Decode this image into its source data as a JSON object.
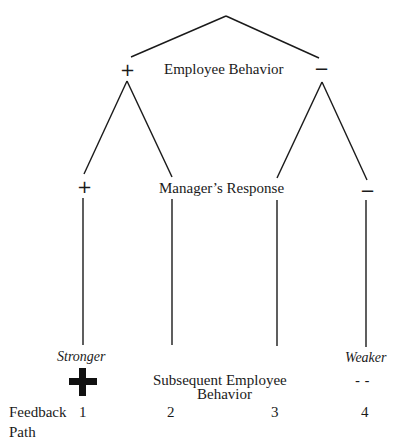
{
  "diagram": {
    "levels": {
      "level1": {
        "label": "Employee Behavior",
        "left_sign": "+",
        "right_sign": "−"
      },
      "level2": {
        "label": "Manager’s Response",
        "left_sign": "+",
        "right_sign": "−"
      },
      "level3": {
        "label_line1": "Subsequent Employee",
        "label_line2": "Behavior"
      }
    },
    "outcomes": {
      "stronger": {
        "label": "Stronger",
        "symbol": "plus-bold"
      },
      "weaker": {
        "label": "Weaker",
        "symbol": "- -"
      }
    },
    "feedback_paths": {
      "label_line1": "Feedback",
      "label_line2": "Path",
      "numbers": [
        "1",
        "2",
        "3",
        "4"
      ]
    },
    "colors": {
      "line": "#1a1a1a",
      "background": "#ffffff"
    }
  }
}
